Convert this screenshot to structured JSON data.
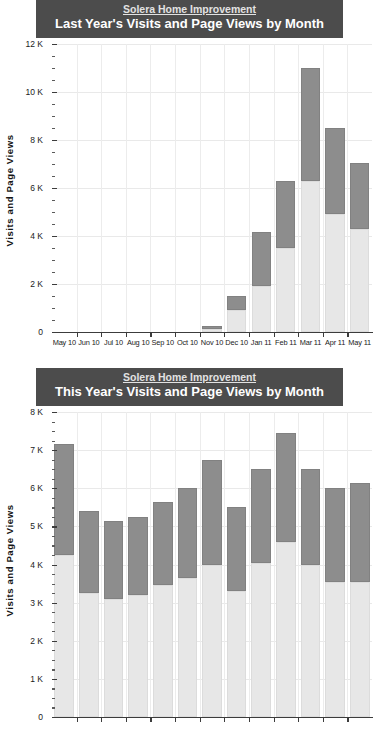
{
  "charts": [
    {
      "org": "Solera Home Improvement",
      "subtitle": "Last Year's Visits and Page Views by Month",
      "ylabel": "Visits and Page Views",
      "chart_data": {
        "type": "bar",
        "stacked": true,
        "title": "Last Year's Visits and Page Views by Month",
        "subtitle": "Solera Home Improvement",
        "xlabel": "",
        "ylabel": "Visits and Page Views",
        "ylim": [
          0,
          12000
        ],
        "ytick_labels": [
          "0",
          "2 K",
          "4 K",
          "6 K",
          "8 K",
          "10 K",
          "12 K"
        ],
        "ytick_values": [
          0,
          2000,
          4000,
          6000,
          8000,
          10000,
          12000
        ],
        "minor_tick_step": 500,
        "grid": true,
        "legend": "none",
        "categories": [
          "May 10",
          "Jun 10",
          "Jul 10",
          "Aug 10",
          "Sep 10",
          "Oct 10",
          "Nov 10",
          "Dec 10",
          "Jan 11",
          "Feb 11",
          "Mar 11",
          "Apr 11",
          "May 11"
        ],
        "series": [
          {
            "name": "Visits",
            "color": "#e7e7e7",
            "values": [
              0,
              0,
              0,
              0,
              0,
              0,
              120,
              900,
              1900,
              3500,
              6300,
              4900,
              4300
            ]
          },
          {
            "name": "Page Views",
            "color": "#8d8d8d",
            "values": [
              0,
              0,
              0,
              0,
              0,
              0,
              130,
              600,
              2250,
              2800,
              4700,
              3600,
              2750
            ]
          }
        ],
        "totals": [
          0,
          0,
          0,
          0,
          0,
          0,
          250,
          1500,
          4150,
          6300,
          11000,
          8500,
          7050
        ]
      }
    },
    {
      "org": "Solera Home Improvement",
      "subtitle": "This Year's Visits and Page Views by Month",
      "ylabel": "Visits and Page Views",
      "chart_data": {
        "type": "bar",
        "stacked": true,
        "title": "This Year's Visits and Page Views by Month",
        "subtitle": "Solera Home Improvement",
        "xlabel": "",
        "ylabel": "Visits and Page Views",
        "ylim": [
          0,
          8000
        ],
        "ytick_labels": [
          "0",
          "1 K",
          "2 K",
          "3 K",
          "4 K",
          "5 K",
          "6 K",
          "7 K",
          "8 K"
        ],
        "ytick_values": [
          0,
          1000,
          2000,
          3000,
          4000,
          5000,
          6000,
          7000,
          8000
        ],
        "minor_tick_step": 250,
        "grid": true,
        "legend": "none",
        "categories": [
          "1",
          "2",
          "3",
          "4",
          "5",
          "6",
          "7",
          "8",
          "9",
          "10",
          "11",
          "12",
          "13"
        ],
        "series": [
          {
            "name": "Visits",
            "color": "#e7e7e7",
            "values": [
              4250,
              3250,
              3100,
              3200,
              3450,
              3650,
              4000,
              3300,
              4050,
              4600,
              4000,
              3550,
              3550
            ]
          },
          {
            "name": "Page Views",
            "color": "#8d8d8d",
            "values": [
              2900,
              2150,
              2050,
              2050,
              2200,
              2350,
              2750,
              2200,
              2450,
              2850,
              2500,
              2450,
              2600
            ]
          }
        ],
        "totals": [
          7150,
          5400,
          5150,
          5250,
          5650,
          6000,
          6750,
          5500,
          6500,
          7450,
          6500,
          6000,
          6150
        ]
      }
    }
  ]
}
